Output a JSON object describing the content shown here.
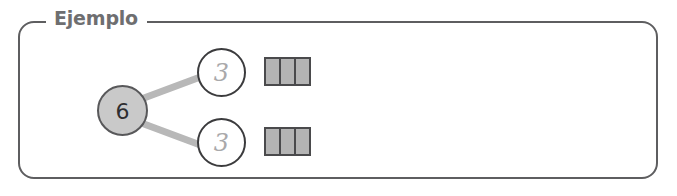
{
  "panel": {
    "legend": "Ejemplo",
    "border_color": "#5e5e60",
    "legend_color": "#6e6e70"
  },
  "diagram": {
    "type": "number-bond",
    "whole": {
      "value": "6",
      "fill_color": "#c9c9c9",
      "border_color": "#58585a",
      "text_color": "#2e2e30"
    },
    "parts": [
      {
        "value": "3",
        "fill_color": "#ffffff",
        "border_color": "#3b3b3d",
        "text_color": "#a9a9ab",
        "blocks": 3
      },
      {
        "value": "3",
        "fill_color": "#ffffff",
        "border_color": "#3b3b3d",
        "text_color": "#a9a9ab",
        "blocks": 3
      }
    ],
    "connector_color": "#b8b8b8"
  }
}
